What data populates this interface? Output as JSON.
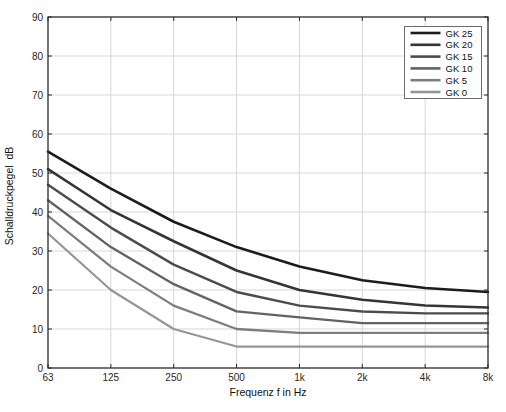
{
  "figure": {
    "background": "#ffffff",
    "axis_color": "#2a2a2a",
    "grid_color": "#d7d7d7",
    "legend_border_color": "#6b6b6b"
  },
  "chart_data": {
    "type": "line",
    "title": "",
    "xlabel": "Frequenz f in Hz",
    "ylabel": "Schalldruckpegel  dB",
    "x_scale": "log-octave",
    "categories": [
      "63",
      "125",
      "250",
      "500",
      "1k",
      "2k",
      "4k",
      "8k"
    ],
    "frequencies_hz": [
      63,
      125,
      250,
      500,
      1000,
      2000,
      4000,
      8000
    ],
    "ylim": [
      0,
      90
    ],
    "ytick_values": [
      0,
      10,
      20,
      30,
      40,
      50,
      60,
      70,
      80,
      90
    ],
    "grid": true,
    "legend_position": "top-right",
    "series": [
      {
        "name": "GK 25",
        "color": "#1c1c1c",
        "values": [
          55.5,
          46.0,
          37.5,
          31.0,
          26.0,
          22.5,
          20.5,
          19.5
        ]
      },
      {
        "name": "GK 20",
        "color": "#353535",
        "values": [
          51.0,
          40.5,
          32.5,
          25.0,
          20.0,
          17.5,
          16.0,
          15.5
        ]
      },
      {
        "name": "GK 15",
        "color": "#4c4c4c",
        "values": [
          47.0,
          36.0,
          26.5,
          19.5,
          16.0,
          14.5,
          14.0,
          14.0
        ]
      },
      {
        "name": "GK 10",
        "color": "#636363",
        "values": [
          43.0,
          31.0,
          21.5,
          14.5,
          13.0,
          11.5,
          11.5,
          11.5
        ]
      },
      {
        "name": "GK 5",
        "color": "#7d7d7d",
        "values": [
          39.0,
          26.0,
          16.0,
          10.0,
          9.0,
          9.0,
          9.0,
          9.0
        ]
      },
      {
        "name": "GK 0",
        "color": "#959595",
        "values": [
          34.5,
          20.0,
          10.0,
          5.5,
          5.5,
          5.5,
          5.5,
          5.5
        ]
      }
    ]
  }
}
